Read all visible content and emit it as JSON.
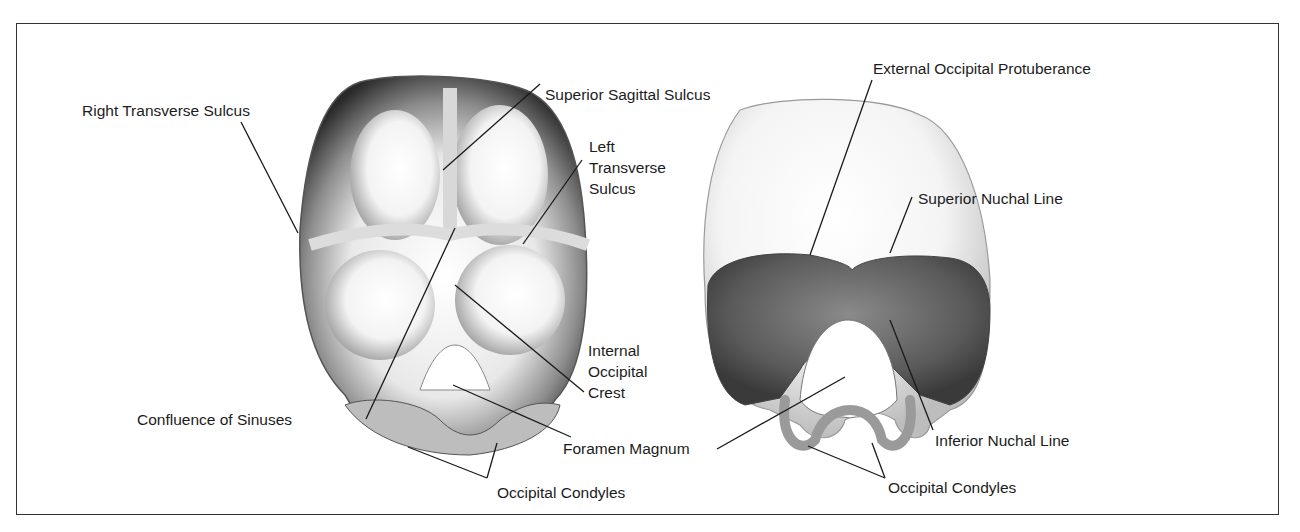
{
  "figure": {
    "left_view": {
      "name": "Internal surface of occipital bone",
      "labels": {
        "right_transverse_sulcus": "Right Transverse Sulcus",
        "superior_sagittal_sulcus": "Superior Sagittal Sulcus",
        "left_transverse_sulcus": [
          "Left",
          "Transverse",
          "Sulcus"
        ],
        "internal_occipital_crest": [
          "Internal",
          "Occipital",
          "Crest"
        ],
        "confluence_of_sinuses": "Confluence of Sinuses",
        "foramen_magnum": "Foramen Magnum",
        "occipital_condyles": "Occipital Condyles"
      }
    },
    "right_view": {
      "name": "External surface of occipital bone",
      "labels": {
        "external_occipital_protuberance": "External Occipital Protuberance",
        "superior_nuchal_line": "Superior Nuchal Line",
        "inferior_nuchal_line": "Inferior Nuchal Line",
        "occipital_condyles": "Occipital Condyles"
      }
    },
    "colors": {
      "border": "#333333",
      "text": "#1c1c1c",
      "leader_line": "#1a1a1a",
      "bone_dark": "#3a3a3a",
      "bone_mid": "#8a8a8a",
      "bone_light": "#f2f2f2"
    }
  }
}
